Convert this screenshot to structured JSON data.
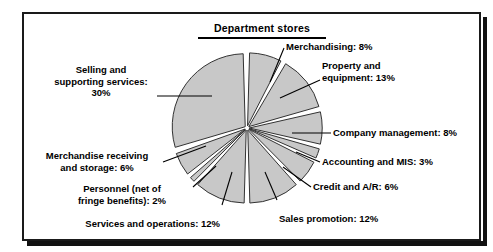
{
  "figure": {
    "title": "Department stores",
    "background_color": "#ffffff",
    "frame_color": "#1a1a1a",
    "slice_fill": "#c8c8c8",
    "slice_stroke": "#333333",
    "text_color": "#000000"
  },
  "chart_data": {
    "type": "pie",
    "title": "Department stores",
    "xlabel": "",
    "ylabel": "",
    "units": "percent",
    "total": 100,
    "start_angle_deg": 0,
    "direction": "clockwise",
    "exploded": true,
    "legend": "none (direct labels with leader lines)",
    "grid": false,
    "categories": [
      "Merchandising",
      "Property and equipment",
      "Company management",
      "Accounting and MIS",
      "Credit and A/R",
      "Sales promotion",
      "Services and operations",
      "Personnel (net of fringe benefits)",
      "Merchandise receiving and storage",
      "Selling and supporting services"
    ],
    "values": [
      8,
      13,
      8,
      3,
      6,
      12,
      12,
      2,
      6,
      30
    ],
    "slices": [
      {
        "label": "Merchandising: 8%",
        "name": "Merchandising",
        "value": 8
      },
      {
        "label": "Property and\nequipment: 13%",
        "name": "Property and equipment",
        "value": 13
      },
      {
        "label": "Company management: 8%",
        "name": "Company management",
        "value": 8
      },
      {
        "label": "Accounting and MIS: 3%",
        "name": "Accounting and MIS",
        "value": 3
      },
      {
        "label": "Credit and A/R: 6%",
        "name": "Credit and A/R",
        "value": 6
      },
      {
        "label": "Sales promotion: 12%",
        "name": "Sales promotion",
        "value": 12
      },
      {
        "label": "Services and operations: 12%",
        "name": "Services and operations",
        "value": 12
      },
      {
        "label": "Personnel (net of\nfringe benefits): 2%",
        "name": "Personnel (net of fringe benefits)",
        "value": 2
      },
      {
        "label": "Merchandise receiving\nand storage: 6%",
        "name": "Merchandise receiving and storage",
        "value": 6
      },
      {
        "label": "Selling and\nsupporting services:\n30%",
        "name": "Selling and supporting services",
        "value": 30
      }
    ]
  }
}
